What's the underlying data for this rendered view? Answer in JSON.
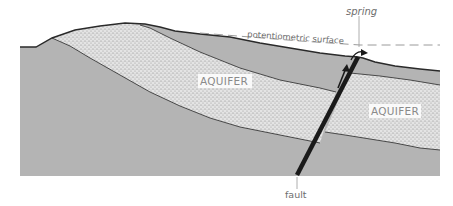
{
  "diagram": {
    "labels": {
      "aquifer_left": "AQUIFER",
      "aquifer_right": "AQUIFER",
      "potentiometric_surface": "potentiometric surface",
      "spring": "spring",
      "fault": "fault"
    },
    "colors": {
      "background": "#ffffff",
      "rock": "#b4b4b4",
      "aquifer_fill": "#e2e2e2",
      "aquifer_dots": "#7a7a7a",
      "boundary_line": "#3a3a3a",
      "fault": "#1a1a1a",
      "dashed_line": "#9a9a9a",
      "label_text": "#6e6e6e",
      "aquifer_label_bg": "#ffffff"
    },
    "elements": [
      "land-surface",
      "confining-layer",
      "aquifer-layer",
      "lower-bedrock",
      "fault-line",
      "flow-arrow",
      "potentiometric-surface-line",
      "spring-marker"
    ]
  }
}
